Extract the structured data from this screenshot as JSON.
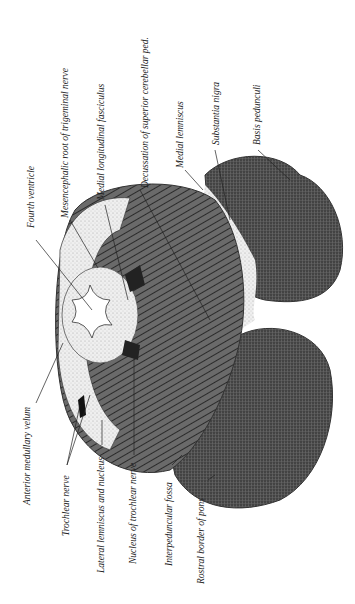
{
  "figure": {
    "labels": {
      "fourth_ventricle": "Fourth ventricle",
      "mesencephalic_root": "Mesencephalic root of trigeminal nerve",
      "medial_longitudinal_fasciculus": "Medial longitudinal fasciculus",
      "decussation": "Decussation of superior cerebellar ped.",
      "medial_lemniscus": "Medial lemniscus",
      "substantia_nigra": "Substantia nigra",
      "basis_pedunculi": "Basis pedunculi",
      "anterior_medullary_velum": "Anterior medullary velum",
      "trochlear_nerve": "Trochlear nerve",
      "lateral_lemniscus": "Lateral lemniscus and nucleus",
      "nucleus_trochlear": "Nucleus of trochlear nerve",
      "interpeduncular_fossa": "Interpeduncular fossa",
      "rostral_border_pons": "Rostral border of pons"
    }
  }
}
